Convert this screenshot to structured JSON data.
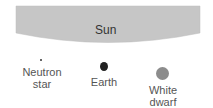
{
  "sun": {
    "label": "Sun",
    "color": "#c4c4c4"
  },
  "objects": [
    {
      "name": "neutron-star",
      "label": "Neutron\nstar",
      "color": "#333333",
      "diameter": 2
    },
    {
      "name": "earth",
      "label": "Earth",
      "color": "#222222",
      "diameter": 8
    },
    {
      "name": "white-dwarf",
      "label": "White\ndwarf",
      "color": "#8c8c8c",
      "diameter": 13
    }
  ]
}
